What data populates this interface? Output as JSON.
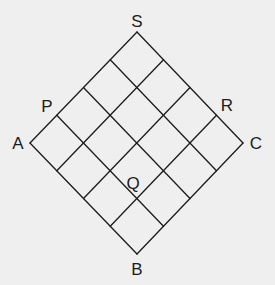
{
  "diagram": {
    "type": "rotated-square-grid",
    "grid_divisions": 4,
    "line_color": "#1c1c1c",
    "background_color": "#efefef",
    "vertices": {
      "S": {
        "x": 137,
        "y": 32
      },
      "C": {
        "x": 243,
        "y": 143
      },
      "B": {
        "x": 137,
        "y": 254
      },
      "A": {
        "x": 30,
        "y": 143
      }
    },
    "labels": [
      {
        "id": "S",
        "text": "S",
        "x": 137,
        "y": 27,
        "anchor": "middle",
        "point": "top vertex"
      },
      {
        "id": "A",
        "text": "A",
        "x": 18,
        "y": 149,
        "anchor": "middle",
        "point": "left vertex"
      },
      {
        "id": "C",
        "text": "C",
        "x": 256,
        "y": 149,
        "anchor": "middle",
        "point": "right vertex"
      },
      {
        "id": "B",
        "text": "B",
        "x": 137,
        "y": 275,
        "anchor": "middle",
        "point": "bottom vertex"
      },
      {
        "id": "P",
        "text": "P",
        "x": 47,
        "y": 112,
        "anchor": "middle",
        "point": "on edge AS, 1/4 from A"
      },
      {
        "id": "R",
        "text": "R",
        "x": 227,
        "y": 111,
        "anchor": "middle",
        "point": "on edge SC, 3/4 from S"
      },
      {
        "id": "Q",
        "text": "Q",
        "x": 133,
        "y": 189,
        "anchor": "middle",
        "point": "interior grid node (1,3)"
      }
    ]
  }
}
